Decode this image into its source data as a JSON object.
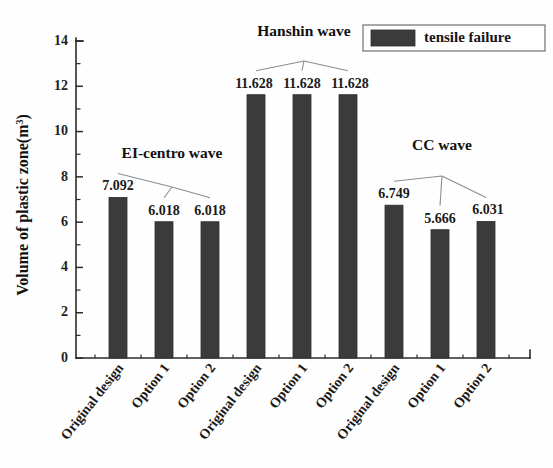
{
  "chart_data": {
    "type": "bar",
    "title": "",
    "xlabel": "",
    "ylabel": "Volume of plastic zone(m",
    "ylabel_exponent": "3",
    "ylabel_suffix": ")",
    "ylim": [
      0,
      14
    ],
    "ytick_labels": [
      "0",
      "2",
      "4",
      "6",
      "8",
      "10",
      "12",
      "14"
    ],
    "ytick_values": [
      0,
      2,
      4,
      6,
      8,
      10,
      12,
      14
    ],
    "yminor_values": [
      1,
      3,
      5,
      7,
      9,
      11,
      13
    ],
    "grid": false,
    "categories": [
      "Original design",
      "Option 1",
      "Option 2",
      "Original design",
      "Option 1",
      "Option 2",
      "Original design",
      "Option 1",
      "Option 2"
    ],
    "values": [
      7.092,
      6.018,
      6.018,
      11.628,
      11.628,
      11.628,
      6.749,
      5.666,
      6.031
    ],
    "value_labels": [
      "7.092",
      "6.018",
      "6.018",
      "11.628",
      "11.628",
      "11.628",
      "6.749",
      "5.666",
      "6.031"
    ],
    "series": [
      {
        "name": "tensile failure",
        "color": "#3b3b3b",
        "values": [
          7.092,
          6.018,
          6.018,
          11.628,
          11.628,
          11.628,
          6.749,
          5.666,
          6.031
        ]
      }
    ],
    "groups": [
      {
        "label": "EI-centro  wave",
        "bar_indices": [
          0,
          1,
          2
        ]
      },
      {
        "label": "Hanshin wave",
        "bar_indices": [
          3,
          4,
          5
        ]
      },
      {
        "label": "CC wave",
        "bar_indices": [
          6,
          7,
          8
        ]
      }
    ],
    "legend": {
      "position": "top-right",
      "entries": [
        {
          "label": "tensile failure",
          "color": "#3b3b3b"
        }
      ]
    },
    "bar_color": "#3b3b3b",
    "axis_color": "#2b2b2b",
    "leader_color": "#8d8d8d"
  }
}
